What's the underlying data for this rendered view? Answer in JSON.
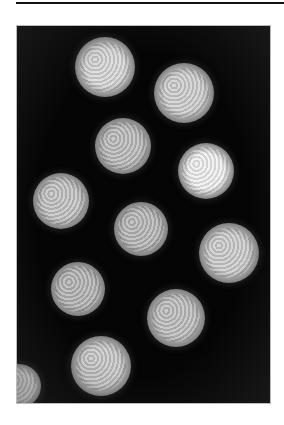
{
  "figure": {
    "particle_count_visible": 11,
    "particles": [
      {
        "cx": 88,
        "cy": 41,
        "r": 30,
        "brightness": "#d8d8d8"
      },
      {
        "cx": 167,
        "cy": 67,
        "r": 30,
        "brightness": "#cfcfcf"
      },
      {
        "cx": 106,
        "cy": 120,
        "r": 28,
        "brightness": "#bdbdbd"
      },
      {
        "cx": 189,
        "cy": 145,
        "r": 28,
        "brightness": "#f0f0f0"
      },
      {
        "cx": 44,
        "cy": 175,
        "r": 28,
        "brightness": "#c4c4c4"
      },
      {
        "cx": 124,
        "cy": 203,
        "r": 27,
        "brightness": "#b8b8b8"
      },
      {
        "cx": 212,
        "cy": 227,
        "r": 30,
        "brightness": "#cdcdcd"
      },
      {
        "cx": 61,
        "cy": 263,
        "r": 27,
        "brightness": "#b5b5b5"
      },
      {
        "cx": 159,
        "cy": 292,
        "r": 29,
        "brightness": "#bfbfbf"
      },
      {
        "cx": 84,
        "cy": 340,
        "r": 30,
        "brightness": "#c8c8c8"
      },
      {
        "cx": 2,
        "cy": 360,
        "r": 22,
        "brightness": "#d0d0d0"
      }
    ],
    "background_color": "#050505"
  }
}
